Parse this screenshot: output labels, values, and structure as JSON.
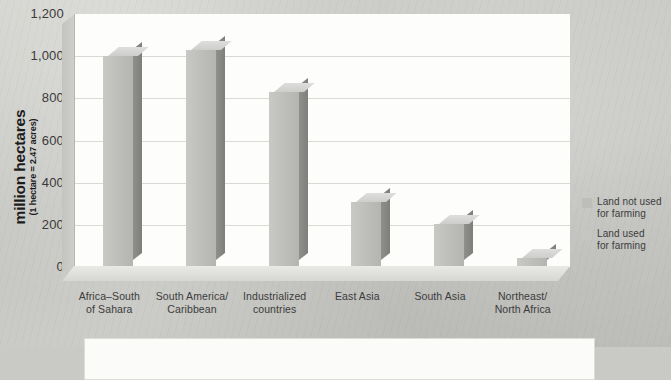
{
  "chart_data": {
    "type": "bar",
    "title": "",
    "subtitle": "",
    "xlabel": "",
    "ylabel": "million hectares",
    "ylabel_sub": "(1 hectare = 2.47 acres)",
    "ylim": [
      0,
      1200
    ],
    "ytick_labels": [
      "1,200",
      "1,000",
      "800",
      "600",
      "400",
      "200",
      "0"
    ],
    "ytick_values": [
      1200,
      1000,
      800,
      600,
      400,
      200,
      0
    ],
    "grid": true,
    "legend_position": "right",
    "categories": [
      "Africa–South of Sahara",
      "South America/ Caribbean",
      "Industrialized countries",
      "East Asia",
      "South Asia",
      "Northeast/ North Africa"
    ],
    "category_lines": [
      [
        "Africa–South",
        "of Sahara"
      ],
      [
        "South America/",
        "Caribbean"
      ],
      [
        "Industrialized",
        "countries"
      ],
      [
        "East Asia",
        ""
      ],
      [
        "South Asia",
        ""
      ],
      [
        "Northeast/",
        "North Africa"
      ]
    ],
    "series": [
      {
        "name": "Land not used for farming",
        "values": [
          1000,
          1030,
          830,
          310,
          205,
          45
        ]
      }
    ],
    "legend": [
      {
        "label_line1": "Land not used",
        "label_line2": "for farming",
        "color": "#bdbdba"
      },
      {
        "label_line1": "Land used",
        "label_line2": "for farming",
        "color": "#c5c5c2"
      }
    ]
  },
  "colors": {
    "page_background": "#c9c9c6",
    "plot_background": "#fdfdfc",
    "gridline": "#d9d9d5",
    "bar_front": "#bdbdba",
    "bar_top": "#d6d6d3",
    "bar_side": "#868683",
    "text": "#3c3c3c",
    "axis_title_text": "#1b1b1b"
  }
}
